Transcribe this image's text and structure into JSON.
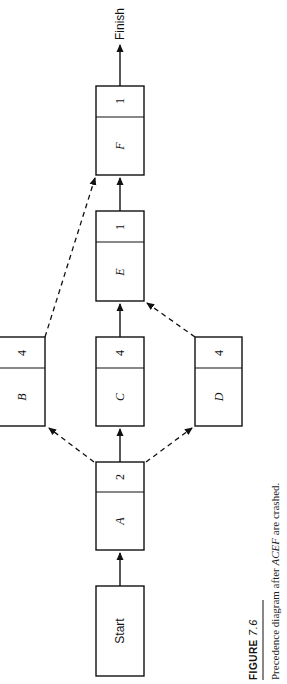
{
  "figure": {
    "number_label": "FIGURE",
    "number": "7.6",
    "caption_prefix": "Precedence diagram after ",
    "caption_emph": "ACEF",
    "caption_suffix": " are crashed."
  },
  "nodes": {
    "start": {
      "label": "Start"
    },
    "finish": {
      "label": "Finish"
    },
    "A": {
      "label": "A",
      "duration": "2"
    },
    "B": {
      "label": "B",
      "duration": "4"
    },
    "C": {
      "label": "C",
      "duration": "4"
    },
    "D": {
      "label": "D",
      "duration": "4"
    },
    "E": {
      "label": "E",
      "duration": "1"
    },
    "F": {
      "label": "F",
      "duration": "1"
    }
  },
  "edges": [
    {
      "from": "Start",
      "to": "A",
      "style": "solid"
    },
    {
      "from": "A",
      "to": "B",
      "style": "dashed"
    },
    {
      "from": "A",
      "to": "C",
      "style": "solid"
    },
    {
      "from": "A",
      "to": "D",
      "style": "dashed"
    },
    {
      "from": "B",
      "to": "F",
      "style": "dashed"
    },
    {
      "from": "C",
      "to": "E",
      "style": "solid"
    },
    {
      "from": "D",
      "to": "E",
      "style": "dashed"
    },
    {
      "from": "E",
      "to": "F",
      "style": "solid"
    },
    {
      "from": "F",
      "to": "Finish",
      "style": "solid"
    }
  ]
}
